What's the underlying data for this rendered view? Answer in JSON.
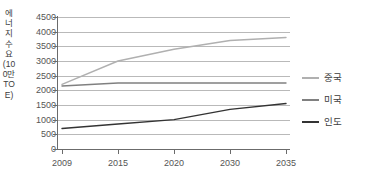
{
  "chart_data": {
    "type": "line",
    "title": "",
    "xlabel": "",
    "ylabel": "에너지 수요(100만TOE)",
    "x": [
      2009,
      2015,
      2020,
      2030,
      2035
    ],
    "xtick_labels": [
      "2009",
      "2015",
      "2020",
      "2030",
      "2035"
    ],
    "ytick_labels": [
      "0",
      "500",
      "1000",
      "1500",
      "2000",
      "2500",
      "3000",
      "3500",
      "4000",
      "4500"
    ],
    "yticks": [
      0,
      500,
      1000,
      1500,
      2000,
      2500,
      3000,
      3500,
      4000,
      4500
    ],
    "ylim": [
      0,
      4500
    ],
    "xlim": [
      2009,
      2035
    ],
    "grid": true,
    "legend_position": "right",
    "series": [
      {
        "name": "중국",
        "color": "#b0b0b0",
        "values": [
          2200,
          3000,
          3400,
          3700,
          3800
        ]
      },
      {
        "name": "미국",
        "color": "#808080",
        "values": [
          2150,
          2250,
          2250,
          2250,
          2250
        ]
      },
      {
        "name": "인도",
        "color": "#333333",
        "values": [
          700,
          850,
          1000,
          1350,
          1550
        ]
      }
    ]
  },
  "legend": {
    "items": [
      {
        "label": "중국",
        "color": "#b0b0b0"
      },
      {
        "label": "미국",
        "color": "#808080"
      },
      {
        "label": "인도",
        "color": "#333333"
      }
    ]
  },
  "colors": {
    "grid": "#b9b9b9",
    "axis": "#6b6b6b",
    "tick_text": "#555555",
    "label_text": "#3c3c3c",
    "background": "#ffffff"
  }
}
